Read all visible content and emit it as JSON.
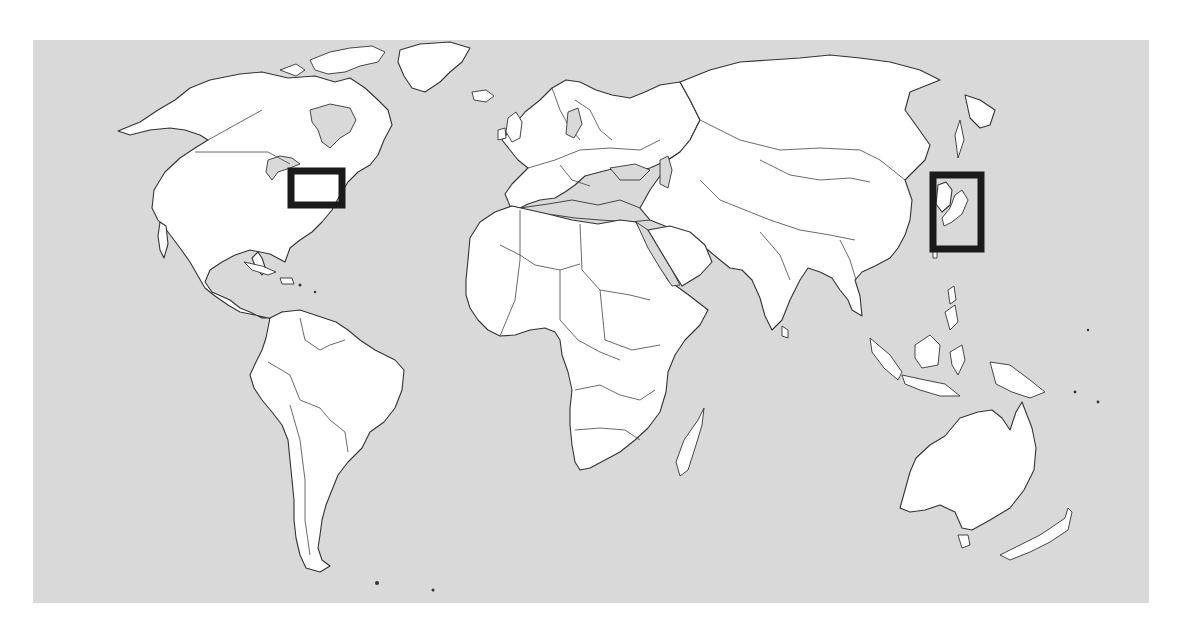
{
  "canvas": {
    "width": 1180,
    "height": 626,
    "background": "#ffffff"
  },
  "map": {
    "projection": "equirectangular-world",
    "frame": {
      "x": 33,
      "y": 40,
      "width": 1116,
      "height": 563
    },
    "colors": {
      "ocean": "#d9d9d9",
      "land": "#ffffff",
      "coastline": "#333333",
      "highlight_box": "#1a1a1a"
    },
    "regions": [
      {
        "name": "North America"
      },
      {
        "name": "Greenland"
      },
      {
        "name": "South America"
      },
      {
        "name": "Europe"
      },
      {
        "name": "Africa"
      },
      {
        "name": "Asia"
      },
      {
        "name": "Southeast Asia"
      },
      {
        "name": "Australia"
      },
      {
        "name": "New Zealand"
      },
      {
        "name": "Madagascar"
      }
    ],
    "highlight_boxes": [
      {
        "id": "box-us-northeast",
        "label": "US Northeast",
        "x": 291,
        "y": 171,
        "width": 51,
        "height": 34,
        "stroke_width": 7
      },
      {
        "id": "box-korea-japan",
        "label": "Korea / Japan",
        "x": 933,
        "y": 175,
        "width": 48,
        "height": 74,
        "stroke_width": 7
      }
    ]
  }
}
